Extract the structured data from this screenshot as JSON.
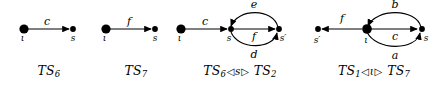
{
  "figure": {
    "width": 442,
    "height": 94,
    "background": "#ffffff",
    "ink": "#000000"
  },
  "panels": [
    {
      "id": "ts6",
      "caption": {
        "base": "TS",
        "sub": "6",
        "full": "TS6"
      },
      "nodes": [
        {
          "name": "iota",
          "label": "ι",
          "size": "large"
        },
        {
          "name": "s",
          "label": "s",
          "size": "small"
        }
      ],
      "edges": [
        {
          "name": "c",
          "label": "c",
          "from": "iota",
          "to": "s",
          "shape": "straight"
        }
      ]
    },
    {
      "id": "ts7",
      "caption": {
        "base": "TS",
        "sub": "7",
        "full": "TS7"
      },
      "nodes": [
        {
          "name": "iota",
          "label": "ι",
          "size": "large"
        },
        {
          "name": "s",
          "label": "s",
          "size": "small"
        }
      ],
      "edges": [
        {
          "name": "f",
          "label": "f",
          "from": "iota",
          "to": "s",
          "shape": "straight"
        }
      ]
    },
    {
      "id": "ts6-s-ts2",
      "caption": {
        "left_base": "TS",
        "left_sub": "6",
        "op_left": "◁",
        "arg": "s",
        "op_right": "▷",
        "right_base": "TS",
        "right_sub": "2",
        "full": "TS6 ◁ s ▷ TS2"
      },
      "nodes": [
        {
          "name": "iota",
          "label": "ι",
          "size": "large"
        },
        {
          "name": "s",
          "label": "s",
          "size": "small"
        },
        {
          "name": "s-prime",
          "label": "s′",
          "size": "small"
        }
      ],
      "edges": [
        {
          "name": "c",
          "label": "c",
          "from": "iota",
          "to": "s",
          "shape": "straight"
        },
        {
          "name": "e",
          "label": "e",
          "from": "s-prime",
          "to": "s",
          "shape": "arc-top"
        },
        {
          "name": "f",
          "label": "f",
          "from": "s",
          "to": "s-prime",
          "shape": "straight"
        },
        {
          "name": "d",
          "label": "d",
          "from": "s",
          "to": "s-prime",
          "shape": "arc-bottom"
        }
      ]
    },
    {
      "id": "ts1-iota-ts7",
      "caption": {
        "left_base": "TS",
        "left_sub": "1",
        "op_left": "◁",
        "arg": "ι",
        "op_right": "▷",
        "right_base": "TS",
        "right_sub": "7",
        "full": "TS1 ◁ ι ▷ TS7"
      },
      "nodes": [
        {
          "name": "s-prime",
          "label": "s′",
          "size": "small"
        },
        {
          "name": "iota",
          "label": "ι",
          "size": "large"
        },
        {
          "name": "s",
          "label": "s",
          "size": "small"
        }
      ],
      "edges": [
        {
          "name": "f",
          "label": "f",
          "from": "iota",
          "to": "s-prime",
          "shape": "straight"
        },
        {
          "name": "b",
          "label": "b",
          "from": "s",
          "to": "iota",
          "shape": "arc-top"
        },
        {
          "name": "c",
          "label": "c",
          "from": "iota",
          "to": "s",
          "shape": "straight"
        },
        {
          "name": "a",
          "label": "a",
          "from": "iota",
          "to": "s",
          "shape": "arc-bottom"
        }
      ]
    }
  ]
}
